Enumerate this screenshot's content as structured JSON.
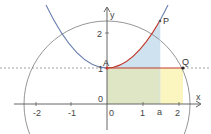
{
  "diagram": {
    "type": "function-graph",
    "axes": {
      "x_label": "x",
      "y_label": "y",
      "x_ticks": [
        "-2",
        "-1",
        "0",
        "1",
        "a",
        "2"
      ],
      "y_ticks": [
        "1",
        "2"
      ],
      "origin_label": "0"
    },
    "points": {
      "A": "A",
      "P": "P",
      "Q": "Q"
    },
    "curves": [
      {
        "name": "parabola",
        "color": "#6a7fb0"
      },
      {
        "name": "circle",
        "color": "#8a8a8a"
      },
      {
        "name": "parabola-segment-A-to-P",
        "color": "#c0392b"
      }
    ],
    "regions": [
      {
        "name": "region-under-parabola",
        "color": "#cfe2ef"
      },
      {
        "name": "rectangle-0-to-a",
        "color": "#dfe6c6"
      },
      {
        "name": "rectangle-a-to-2",
        "color": "#fbf5c0"
      }
    ],
    "lines": [
      {
        "name": "segment-AQ",
        "color": "#c0392b"
      },
      {
        "name": "dashed-line-y1",
        "color": "#888888"
      }
    ],
    "colors": {
      "axis": "#555555",
      "red": "#c0392b",
      "blue_curve": "#6a7fb0",
      "circle": "#8a8a8a"
    }
  }
}
